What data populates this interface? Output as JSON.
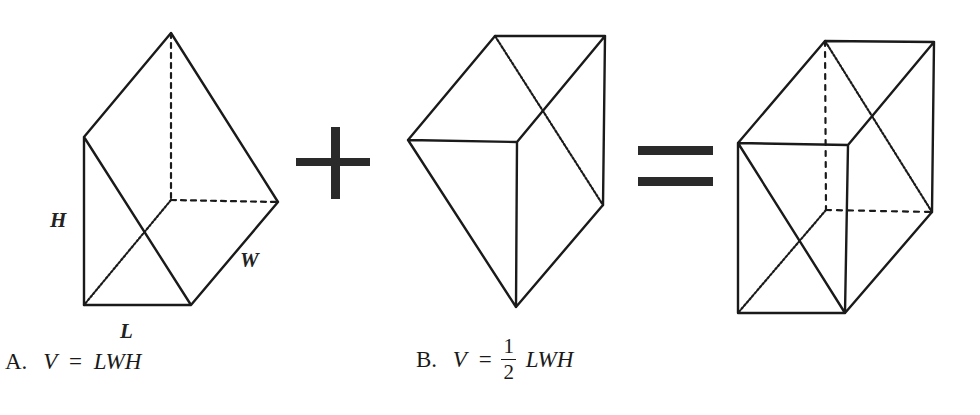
{
  "figure": {
    "operators": {
      "plus": "+",
      "equals": "="
    },
    "shape_labels": {
      "height": "H",
      "width": "W",
      "length": "L"
    },
    "shapes": [
      {
        "id": "prism-a",
        "description": "Triangular prism (half of rectangular box) with hidden edges dashed"
      },
      {
        "id": "prism-b",
        "description": "Complementary triangular prism"
      },
      {
        "id": "box",
        "description": "Rectangular prism formed by combining both halves, with diagonal cut shown"
      }
    ]
  },
  "answers": {
    "a": {
      "letter": "A.",
      "lhs": "V",
      "eq": "=",
      "rhs": "LWH"
    },
    "b": {
      "letter": "B.",
      "lhs": "V",
      "eq": "=",
      "frac_num": "1",
      "frac_den": "2",
      "rhs": "LWH"
    }
  },
  "colors": {
    "stroke": "#1a1a1a",
    "background": "#ffffff"
  }
}
